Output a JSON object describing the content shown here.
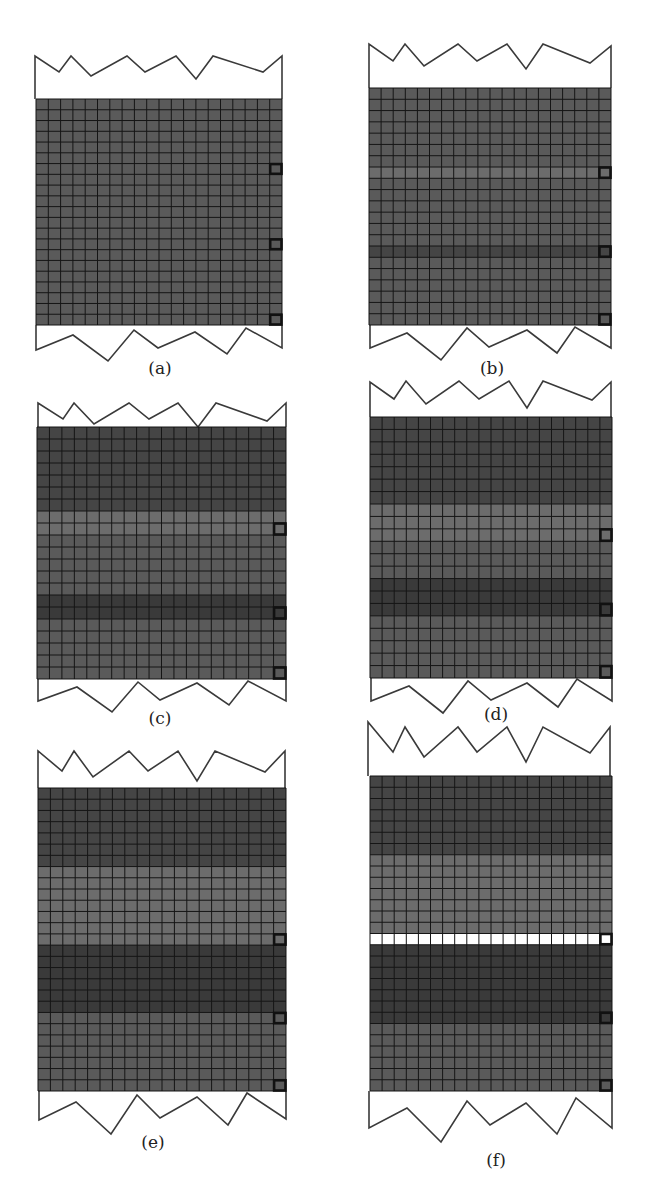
{
  "figure": {
    "grid": {
      "cols": 20,
      "rows": 21
    },
    "colors": {
      "band_base": "#5a5a5a",
      "band_dark": "#454545",
      "band_darker": "#3a3a3a",
      "band_light": "#6c6c6c",
      "grid_line": "#151515",
      "outline": "#3a3a3a",
      "marker": "#111111",
      "crack_row": "#ffffff"
    },
    "panels": [
      {
        "id": "a",
        "label": "(a)",
        "mesh": {
          "x": 36,
          "y": 99,
          "w": 246,
          "h": 226
        },
        "top_outline": [
          [
            35,
            56
          ],
          [
            59,
            72
          ],
          [
            71,
            56
          ],
          [
            91,
            76
          ],
          [
            127,
            56
          ],
          [
            145,
            72
          ],
          [
            176,
            56
          ],
          [
            196,
            79
          ],
          [
            213,
            56
          ],
          [
            263,
            72
          ],
          [
            282,
            56
          ]
        ],
        "bottom_outline": [
          [
            36,
            350
          ],
          [
            73,
            335
          ],
          [
            108,
            361
          ],
          [
            134,
            330
          ],
          [
            158,
            348
          ],
          [
            195,
            332
          ],
          [
            227,
            354
          ],
          [
            246,
            328
          ],
          [
            282,
            348
          ]
        ],
        "label_pos": [
          160,
          374
        ],
        "bands": [
          {
            "from": 0,
            "to": 21,
            "tone": "band_base"
          }
        ],
        "markers": [
          6,
          13,
          20
        ],
        "crack_row": null
      },
      {
        "id": "b",
        "label": "(b)",
        "mesh": {
          "x": 369,
          "y": 88,
          "w": 242,
          "h": 237
        },
        "top_outline": [
          [
            369,
            44
          ],
          [
            393,
            61
          ],
          [
            405,
            44
          ],
          [
            424,
            66
          ],
          [
            458,
            44
          ],
          [
            477,
            61
          ],
          [
            507,
            44
          ],
          [
            526,
            69
          ],
          [
            543,
            44
          ],
          [
            590,
            63
          ],
          [
            611,
            46
          ]
        ],
        "bottom_outline": [
          [
            370,
            348
          ],
          [
            407,
            333
          ],
          [
            441,
            360
          ],
          [
            467,
            328
          ],
          [
            489,
            347
          ],
          [
            527,
            330
          ],
          [
            557,
            353
          ],
          [
            575,
            327
          ],
          [
            611,
            348
          ]
        ],
        "label_pos": [
          492,
          374
        ],
        "bands": [
          {
            "from": 0,
            "to": 7,
            "tone": "band_base"
          },
          {
            "from": 7,
            "to": 8,
            "tone": "band_light"
          },
          {
            "from": 8,
            "to": 14,
            "tone": "band_base"
          },
          {
            "from": 14,
            "to": 15,
            "tone": "band_dark"
          },
          {
            "from": 15,
            "to": 21,
            "tone": "band_base"
          }
        ],
        "markers": [
          7,
          14,
          20
        ],
        "crack_row": null
      },
      {
        "id": "c",
        "label": "(c)",
        "mesh": {
          "x": 37,
          "y": 427,
          "w": 249,
          "h": 252
        },
        "top_outline": [
          [
            38,
            403
          ],
          [
            63,
            419
          ],
          [
            74,
            403
          ],
          [
            94,
            424
          ],
          [
            129,
            403
          ],
          [
            149,
            419
          ],
          [
            178,
            403
          ],
          [
            198,
            427
          ],
          [
            216,
            403
          ],
          [
            267,
            421
          ],
          [
            286,
            403
          ]
        ],
        "bottom_outline": [
          [
            38,
            701
          ],
          [
            77,
            687
          ],
          [
            112,
            712
          ],
          [
            138,
            682
          ],
          [
            160,
            700
          ],
          [
            197,
            683
          ],
          [
            229,
            705
          ],
          [
            248,
            681
          ],
          [
            286,
            701
          ]
        ],
        "label_pos": [
          160,
          724
        ],
        "bands": [
          {
            "from": 0,
            "to": 7,
            "tone": "band_dark"
          },
          {
            "from": 7,
            "to": 9,
            "tone": "band_light"
          },
          {
            "from": 9,
            "to": 14,
            "tone": "band_base"
          },
          {
            "from": 14,
            "to": 16,
            "tone": "band_darker"
          },
          {
            "from": 16,
            "to": 21,
            "tone": "band_base"
          }
        ],
        "markers": [
          8,
          15,
          20
        ],
        "crack_row": null
      },
      {
        "id": "d",
        "label": "(d)",
        "mesh": {
          "x": 370,
          "y": 417,
          "w": 242,
          "h": 261
        },
        "top_outline": [
          [
            370,
            382
          ],
          [
            394,
            399
          ],
          [
            406,
            381
          ],
          [
            426,
            404
          ],
          [
            459,
            381
          ],
          [
            479,
            399
          ],
          [
            509,
            381
          ],
          [
            527,
            408
          ],
          [
            543,
            381
          ],
          [
            592,
            400
          ],
          [
            611,
            382
          ]
        ],
        "bottom_outline": [
          [
            371,
            701
          ],
          [
            409,
            686
          ],
          [
            443,
            713
          ],
          [
            468,
            681
          ],
          [
            491,
            700
          ],
          [
            527,
            683
          ],
          [
            558,
            707
          ],
          [
            577,
            679
          ],
          [
            612,
            701
          ]
        ],
        "label_pos": [
          496,
          720
        ],
        "bands": [
          {
            "from": 0,
            "to": 7,
            "tone": "band_dark"
          },
          {
            "from": 7,
            "to": 10,
            "tone": "band_light"
          },
          {
            "from": 10,
            "to": 13,
            "tone": "band_base"
          },
          {
            "from": 13,
            "to": 16,
            "tone": "band_darker"
          },
          {
            "from": 16,
            "to": 21,
            "tone": "band_base"
          }
        ],
        "markers": [
          9,
          15,
          20
        ],
        "crack_row": null
      },
      {
        "id": "e",
        "label": "(e)",
        "mesh": {
          "x": 38,
          "y": 788,
          "w": 248,
          "h": 303
        },
        "top_outline": [
          [
            38,
            751
          ],
          [
            62,
            771
          ],
          [
            74,
            751
          ],
          [
            93,
            777
          ],
          [
            129,
            751
          ],
          [
            148,
            771
          ],
          [
            178,
            751
          ],
          [
            197,
            781
          ],
          [
            215,
            751
          ],
          [
            265,
            772
          ],
          [
            285,
            751
          ]
        ],
        "bottom_outline": [
          [
            39,
            1120
          ],
          [
            76,
            1102
          ],
          [
            111,
            1134
          ],
          [
            137,
            1095
          ],
          [
            160,
            1118
          ],
          [
            197,
            1097
          ],
          [
            228,
            1125
          ],
          [
            247,
            1093
          ],
          [
            286,
            1119
          ]
        ],
        "label_pos": [
          153,
          1148
        ],
        "bands": [
          {
            "from": 0,
            "to": 7,
            "tone": "band_dark"
          },
          {
            "from": 7,
            "to": 14,
            "tone": "band_light"
          },
          {
            "from": 14,
            "to": 20,
            "tone": "band_darker"
          },
          {
            "from": 20,
            "to": 27,
            "tone": "band_base"
          }
        ],
        "rows_override": 27,
        "markers": [
          13,
          20,
          26
        ],
        "crack_row": null
      },
      {
        "id": "f",
        "label": "(f)",
        "mesh": {
          "x": 370,
          "y": 776,
          "w": 242,
          "h": 315
        },
        "top_outline": [
          [
            368,
            722
          ],
          [
            393,
            752
          ],
          [
            405,
            727
          ],
          [
            424,
            757
          ],
          [
            458,
            727
          ],
          [
            477,
            752
          ],
          [
            507,
            727
          ],
          [
            526,
            762
          ],
          [
            543,
            727
          ],
          [
            590,
            753
          ],
          [
            610,
            727
          ]
        ],
        "bottom_outline": [
          [
            369,
            1128
          ],
          [
            407,
            1108
          ],
          [
            441,
            1142
          ],
          [
            467,
            1101
          ],
          [
            490,
            1125
          ],
          [
            526,
            1103
          ],
          [
            557,
            1134
          ],
          [
            576,
            1098
          ],
          [
            612,
            1128
          ]
        ],
        "label_pos": [
          496,
          1166
        ],
        "bands": [
          {
            "from": 0,
            "to": 7,
            "tone": "band_dark"
          },
          {
            "from": 7,
            "to": 14,
            "tone": "band_light"
          },
          {
            "from": 14,
            "to": 15,
            "tone": "band_light"
          },
          {
            "from": 15,
            "to": 22,
            "tone": "band_darker"
          },
          {
            "from": 22,
            "to": 28,
            "tone": "band_base"
          }
        ],
        "rows_override": 28,
        "markers": [
          14,
          21,
          27
        ],
        "crack_row": 14
      }
    ]
  }
}
